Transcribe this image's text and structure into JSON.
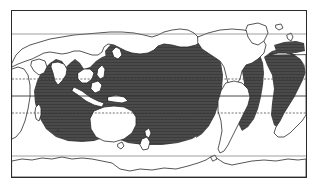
{
  "figure": {
    "type": "distribution-map",
    "title": "",
    "caption": "",
    "projection": "equirectangular",
    "frame": {
      "x": 11,
      "y": 10,
      "width": 294,
      "height": 166,
      "border_color": "#2b2b2b"
    },
    "background_color": "#ffffff"
  },
  "legend": {
    "entries": [
      {
        "label": "",
        "symbol": "shaded-area",
        "color": "#4a4a4a",
        "meaning": "distribution range"
      },
      {
        "label": "",
        "symbol": "point-record",
        "color": "#3a3a3a",
        "meaning": "isolated record"
      }
    ],
    "position": "none"
  },
  "colors": {
    "range_fill": "#4a4a4a",
    "range_hatch": "#3c3c3c",
    "land_fill": "#ffffff",
    "coastline": "#2b2b2b",
    "graticule_solid": "#555555",
    "graticule_dashed": "#333333",
    "frame": "#2b2b2b",
    "point_marker": "#3a3a3a"
  },
  "graticule": {
    "lines": [
      {
        "name": "upper-latitude-line",
        "label": "",
        "y_px": 33,
        "style": "solid",
        "color": "#777777"
      },
      {
        "name": "tropic-of-cancer",
        "label": "",
        "y_px": 78,
        "style": "dashed",
        "color": "#333333"
      },
      {
        "name": "equator",
        "label": "",
        "y_px": 95,
        "style": "solid",
        "color": "#333333"
      },
      {
        "name": "tropic-of-capricorn",
        "label": "",
        "y_px": 112,
        "style": "dashed",
        "color": "#333333"
      },
      {
        "name": "lower-latitude-line",
        "label": "",
        "y_px": 155,
        "style": "solid",
        "color": "#777777"
      }
    ],
    "meridians": []
  },
  "chart_data": {
    "type": "map",
    "title": "",
    "xlabel": "",
    "ylabel": "",
    "xlim": [
      20,
      380
    ],
    "ylim": [
      -90,
      90
    ],
    "grid": true,
    "legend_position": "none",
    "series": [
      {
        "name": "distribution range",
        "fill": "#4a4a4a",
        "regions": [
          "Indian Ocean",
          "western Pacific Ocean",
          "central Pacific Ocean",
          "eastern Pacific Ocean",
          "western Atlantic Ocean",
          "eastern Atlantic Ocean",
          "Sea of Japan",
          "Gulf of Alaska",
          "Gulf of Mexico / Caribbean",
          "Mediterranean Sea",
          "Red Sea / Arabian Sea"
        ],
        "latitude_extent_deg": [
          -45,
          62
        ],
        "notes": "circumglobal tropical to temperate marine distribution"
      },
      {
        "name": "isolated record",
        "marker": "square",
        "points": [
          {
            "x_px": 57,
            "y_px": 130,
            "label": ""
          }
        ]
      }
    ],
    "landmasses_unshaded": [
      "Africa",
      "Europe",
      "Asia",
      "Australia",
      "Tasmania",
      "New Zealand",
      "North America",
      "South America",
      "Greenland",
      "Antarctica",
      "Madagascar",
      "Japan",
      "Borneo",
      "New Guinea",
      "British Isles",
      "Iceland"
    ]
  }
}
